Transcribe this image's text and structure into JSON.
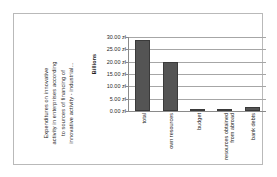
{
  "chart_data": {
    "type": "bar",
    "title": "Expenditures on innovative activity in enterprises according to sources of financing of innovative activity - industrial...",
    "title_lines": [
      "Expenditures on innovative",
      "activity in enterprises according",
      "to sources of financing of",
      "innovative activity - industrial..."
    ],
    "categories": [
      "total",
      "own resources",
      "budget",
      "resources obtained from abroad",
      "bank debts"
    ],
    "category_lines": [
      [
        "total"
      ],
      [
        "own resources"
      ],
      [
        "budget"
      ],
      [
        "resources obtained",
        "from abroad"
      ],
      [
        "bank debts"
      ]
    ],
    "values": [
      28.7,
      19.7,
      0.5,
      0.3,
      1.8
    ],
    "xlabel": "",
    "ylabel": "Billions",
    "ylim": [
      0,
      30
    ],
    "yticks": [
      30,
      25,
      20,
      15,
      10,
      5,
      0
    ],
    "ytick_labels": [
      "30.00 zł",
      "25.00 zł",
      "20.00 zł",
      "15.00 zł",
      "10.00 zł",
      "5.00 zł",
      "0.00 zł"
    ],
    "currency": "zł",
    "unit_multiplier": "Billions",
    "grid": true,
    "legend": false,
    "bar_color": "#545454",
    "grid_color": "#a6a6a6",
    "axis_color": "#8a8a8a",
    "background": "#ffffff"
  }
}
